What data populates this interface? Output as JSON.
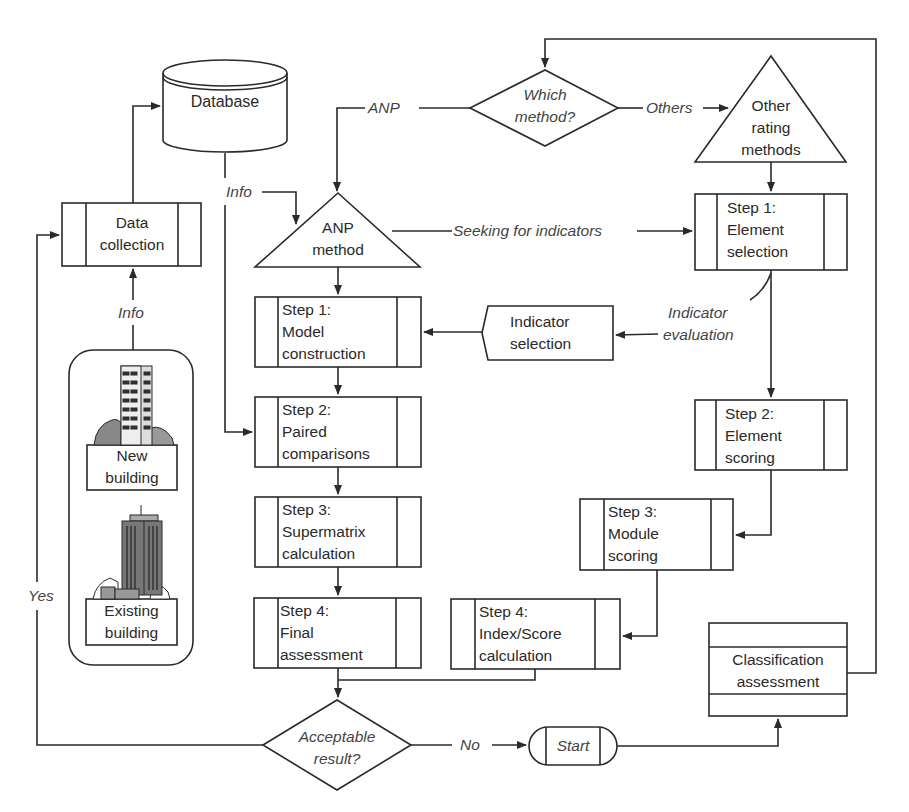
{
  "diagram": {
    "type": "flowchart",
    "nodes": {
      "database": {
        "label": "Database",
        "shape": "cylinder"
      },
      "data_collection": {
        "line1": "Data",
        "line2": "collection",
        "shape": "predefined-process"
      },
      "which_method": {
        "line1": "Which",
        "line2": "method?",
        "shape": "decision"
      },
      "other_rating": {
        "line1": "Other",
        "line2": "rating",
        "line3": "methods",
        "shape": "triangle"
      },
      "anp_method": {
        "line1": "ANP",
        "line2": "method",
        "shape": "triangle"
      },
      "element_selection": {
        "line1": "Step 1:",
        "line2": "Element",
        "line3": "selection",
        "shape": "predefined-process"
      },
      "model_construction": {
        "line1": "Step 1:",
        "line2": "Model",
        "line3": "construction",
        "shape": "predefined-process"
      },
      "indicator_selection": {
        "line1": "Indicator",
        "line2": "selection",
        "shape": "display"
      },
      "paired_comparisons": {
        "line1": "Step 2:",
        "line2": "Paired",
        "line3": "comparisons",
        "shape": "predefined-process"
      },
      "element_scoring": {
        "line1": "Step 2:",
        "line2": "Element",
        "line3": "scoring",
        "shape": "predefined-process"
      },
      "supermatrix": {
        "line1": "Step 3:",
        "line2": "Supermatrix",
        "line3": "calculation",
        "shape": "predefined-process"
      },
      "module_scoring": {
        "line1": "Step 3:",
        "line2": "Module",
        "line3": "scoring",
        "shape": "predefined-process"
      },
      "final_assessment": {
        "line1": "Step 4:",
        "line2": "Final",
        "line3": "assessment",
        "shape": "predefined-process"
      },
      "index_score": {
        "line1": "Step 4:",
        "line2": "Index/Score",
        "line3": "calculation",
        "shape": "predefined-process"
      },
      "classification": {
        "line1": "Classification",
        "line2": "assessment",
        "shape": "card"
      },
      "acceptable": {
        "line1": "Acceptable",
        "line2": "result?",
        "shape": "decision"
      },
      "start": {
        "label": "Start",
        "shape": "terminator"
      },
      "new_building": {
        "line1": "New",
        "line2": "building",
        "icon": "building-icon"
      },
      "existing_building": {
        "line1": "Existing",
        "line2": "building",
        "icon": "skyscraper-icon"
      }
    },
    "edge_labels": {
      "anp": "ANP",
      "others": "Others",
      "info_db": "Info",
      "info_buildings": "Info",
      "seeking": "Seeking for indicators",
      "indicator_eval_1": "Indicator",
      "indicator_eval_2": "evaluation",
      "yes": "Yes",
      "no": "No"
    },
    "colors": {
      "stroke": "#2a2a2a",
      "background": "#ffffff",
      "icon_fill": "#777777"
    }
  }
}
